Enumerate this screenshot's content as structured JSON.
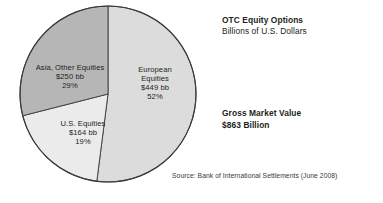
{
  "header": {
    "title": "OTC Equity Options",
    "subtitle": "Billions of U.S. Dollars"
  },
  "summary": {
    "label": "Gross Market Value",
    "value": "$863 Billion"
  },
  "source": {
    "text": "Source: Bank of International Settlements (June 2008)"
  },
  "chart_data": {
    "type": "pie",
    "title": "OTC Equity Options",
    "subtitle": "Billions of U.S. Dollars",
    "unit": "Billions of U.S. Dollars",
    "total_label": "Gross Market Value",
    "total_value": 863,
    "total_value_text": "$863 Billion",
    "legend": "none",
    "labels_inside_slices": true,
    "start_angle_deg": 0,
    "direction": "clockwise",
    "categories": [
      "European Equities",
      "U.S. Equities",
      "Asia, Other Equities"
    ],
    "values": [
      449,
      164,
      250
    ],
    "percentages": [
      52,
      19,
      29
    ],
    "colors": [
      "#dcdcdc",
      "#ebebeb",
      "#b6b6b6"
    ],
    "slices": [
      {
        "name": "European Equities",
        "name_line1": "European",
        "name_line2": "Equities",
        "value": 449,
        "value_text": "$449 bb",
        "percent": 52,
        "percent_text": "52%",
        "color": "#dcdcdc",
        "start_angle_deg": 0,
        "end_angle_deg": 187.2
      },
      {
        "name": "U.S. Equities",
        "name_line1": "U.S. Equities",
        "name_line2": "",
        "value": 164,
        "value_text": "$164 bb",
        "percent": 19,
        "percent_text": "19%",
        "color": "#ebebeb",
        "start_angle_deg": 187.2,
        "end_angle_deg": 255.6
      },
      {
        "name": "Asia, Other Equities",
        "name_line1": "Asia, Other Equities",
        "name_line2": "",
        "value": 250,
        "value_text": "$250 bb",
        "percent": 29,
        "percent_text": "29%",
        "color": "#b6b6b6",
        "start_angle_deg": 255.6,
        "end_angle_deg": 360
      }
    ],
    "outline_color": "#3a3a3a"
  }
}
